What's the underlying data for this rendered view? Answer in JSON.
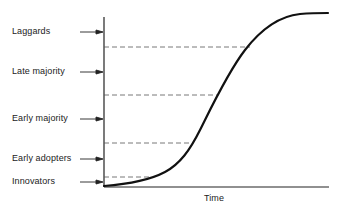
{
  "diagram": {
    "type": "s-curve",
    "x_axis_label": "Time",
    "y_axis_categories": [
      {
        "label": "Laggards",
        "y": 32
      },
      {
        "label": "Late majority",
        "y": 72
      },
      {
        "label": "Early majority",
        "y": 119
      },
      {
        "label": "Early adopters",
        "y": 159
      },
      {
        "label": "Innovators",
        "y": 182
      }
    ],
    "threshold_lines": [
      {
        "y": 47,
        "x_end": 250
      },
      {
        "y": 95,
        "x_end": 218
      },
      {
        "y": 143,
        "x_end": 192
      },
      {
        "y": 177,
        "x_end": 150
      }
    ],
    "colors": {
      "curve": "#111111",
      "axis": "#222222",
      "dashes": "#555555",
      "text": "#222222"
    }
  }
}
